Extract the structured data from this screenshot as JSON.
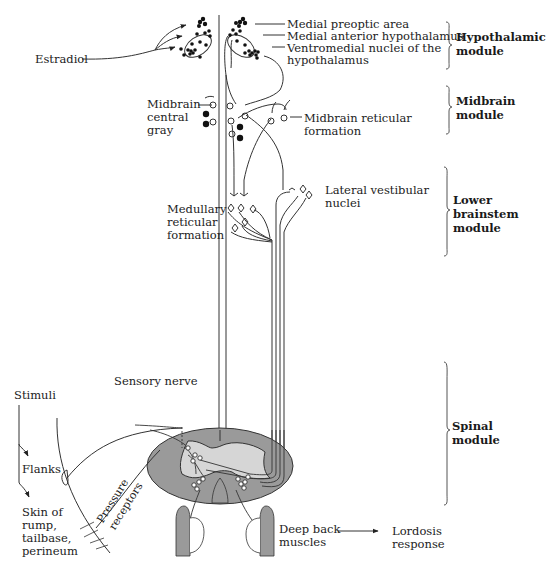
{
  "diagram": {
    "colors": {
      "line": "#333333",
      "gray_matter": "#9a9a9a",
      "white_matter": "#d6d6d6",
      "muscle": "#9a9a9a",
      "text": "#222222"
    },
    "input_label": "Estradiol",
    "hypothalamus_labels": [
      "Medial preoptic area",
      "Medial anterior hypothalamus",
      "Ventromedial nuclei of the",
      "hypothalamus"
    ],
    "midbrain_labels": {
      "central_gray": [
        "Midbrain",
        "central",
        "gray"
      ],
      "reticular": [
        "Midbrain reticular",
        "formation"
      ]
    },
    "brainstem_labels": {
      "medullary": [
        "Medullary",
        "reticular",
        "formation"
      ],
      "vestibular": [
        "Lateral vestibular",
        "nuclei"
      ]
    },
    "spinal_labels": {
      "sensory_nerve": "Sensory nerve",
      "stimuli": "Stimuli",
      "flanks": "Flanks",
      "skin": [
        "Skin of",
        "rump,",
        "tailbase,",
        "perineum"
      ],
      "pressure_receptors": [
        "Pressure",
        "receptors"
      ],
      "deep_back_muscles": [
        "Deep back",
        "muscles"
      ],
      "lordosis_response": [
        "Lordosis",
        "response"
      ]
    },
    "modules": [
      {
        "name": "Hypothalamic",
        "suffix": "module"
      },
      {
        "name": "Midbrain",
        "suffix": "module"
      },
      {
        "name": "Lower",
        "line2": "brainstem",
        "suffix": "module"
      },
      {
        "name": "Spinal",
        "suffix": "module"
      }
    ]
  }
}
